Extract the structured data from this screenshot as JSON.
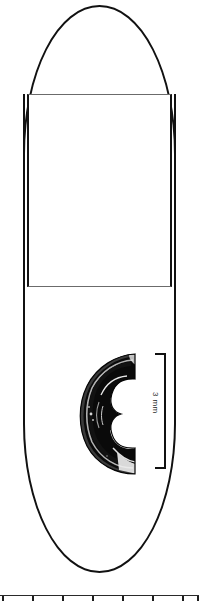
{
  "figure": {
    "background_color": "#ffffff",
    "ink_color": "#111111",
    "orientation_note": "image rotated 90 degrees"
  },
  "plate": {
    "outline_name": "capsule outline",
    "inner_rect_name": "inner rectangle region",
    "outline_stroke_color": "#111111",
    "inner_rect_stroke_color": "#6b6b6b"
  },
  "specimen": {
    "label": "crescent cross-section",
    "fill_color": "#0a0a0a",
    "highlight_color": "#d8d8d8"
  },
  "scale": {
    "label": "3 mm",
    "value": 3,
    "unit": "mm",
    "bar_color": "#111111"
  },
  "ruler": {
    "label": "bottom ruler strip",
    "tick_color": "#1d1d1d",
    "line_color": "#2a2a2a",
    "tick_positions": [
      2,
      32,
      62,
      92,
      122,
      152,
      182,
      197
    ]
  }
}
